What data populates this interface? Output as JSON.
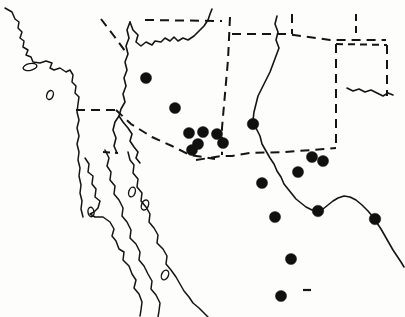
{
  "figure": {
    "kind": "distribution-map",
    "region": "Southwestern United States and Northwestern Mexico",
    "background_color": "#fdfdfc",
    "ink_color": "#141414",
    "dot_color": "#101010",
    "width": 405,
    "height": 317
  },
  "chart_data": {
    "type": "scatter",
    "title": "",
    "xlabel": "",
    "ylabel": "",
    "grid": false,
    "legend": null,
    "xlim": [
      0,
      405
    ],
    "ylim": [
      317,
      0
    ],
    "series": [
      {
        "name": "locality records",
        "marker": "filled-circle",
        "color": "#101010",
        "points": [
          {
            "id": "pt-01",
            "x": 146,
            "y": 78,
            "r": 5.6,
            "note": "north-central Arizona"
          },
          {
            "id": "pt-02",
            "x": 175,
            "y": 108,
            "r": 5.6,
            "note": "central Arizona"
          },
          {
            "id": "pt-03",
            "x": 189,
            "y": 133,
            "r": 5.6,
            "note": "southeast Arizona cluster"
          },
          {
            "id": "pt-04",
            "x": 203,
            "y": 132,
            "r": 5.6,
            "note": "southeast Arizona cluster"
          },
          {
            "id": "pt-05",
            "x": 198,
            "y": 144,
            "r": 5.6,
            "note": "southeast Arizona cluster"
          },
          {
            "id": "pt-06",
            "x": 192,
            "y": 150,
            "r": 5.6,
            "note": "southeast Arizona cluster"
          },
          {
            "id": "pt-07",
            "x": 217,
            "y": 134,
            "r": 5.6,
            "note": "southwest New Mexico cluster"
          },
          {
            "id": "pt-08",
            "x": 223,
            "y": 143,
            "r": 5.6,
            "note": "southwest New Mexico cluster"
          },
          {
            "id": "pt-09",
            "x": 253,
            "y": 124,
            "r": 5.8,
            "note": "Rio Grande valley, New Mexico"
          },
          {
            "id": "pt-10",
            "x": 312,
            "y": 157,
            "r": 5.6,
            "note": "southern New Mexico"
          },
          {
            "id": "pt-11",
            "x": 323,
            "y": 161,
            "r": 5.6,
            "note": "west Texas"
          },
          {
            "id": "pt-12",
            "x": 298,
            "y": 172,
            "r": 5.6,
            "note": "west Texas"
          },
          {
            "id": "pt-13",
            "x": 262,
            "y": 183,
            "r": 5.6,
            "note": "northern Chihuahua"
          },
          {
            "id": "pt-14",
            "x": 275,
            "y": 217,
            "r": 5.6,
            "note": "central Chihuahua"
          },
          {
            "id": "pt-15",
            "x": 318,
            "y": 211,
            "r": 5.8,
            "note": "Big Bend / Rio Grande"
          },
          {
            "id": "pt-16",
            "x": 375,
            "y": 219,
            "r": 5.8,
            "note": "lower Rio Grande"
          },
          {
            "id": "pt-17",
            "x": 291,
            "y": 259,
            "r": 5.6,
            "note": "southern Chihuahua"
          },
          {
            "id": "pt-18",
            "x": 281,
            "y": 296,
            "r": 5.6,
            "note": "Durango / Zacatecas"
          }
        ]
      }
    ],
    "annotations": [
      {
        "id": "dash-mark",
        "type": "short-horizontal-dash",
        "x": 307,
        "y": 290,
        "length": 8
      }
    ],
    "total_points": 18
  },
  "layers": {
    "coastlines": {
      "label": "coastline",
      "count": 4,
      "description": "Pacific coast of California, outer and inner shores of the Baja California peninsula, and the mainland shore of the Gulf of California"
    },
    "islands": {
      "label": "islands",
      "count": 6,
      "description": "small offshore islands in the Pacific and Gulf of California"
    },
    "rivers": {
      "label": "river",
      "count": 2,
      "description": "Colorado River drainage and the Rio Grande forming the Texas-Mexico boundary"
    },
    "political_borders": {
      "label": "state boundary",
      "style": "dashed",
      "description": "state lines of Nevada, Utah, Arizona, New Mexico, Colorado, and the Texas and Oklahoma panhandles"
    }
  }
}
